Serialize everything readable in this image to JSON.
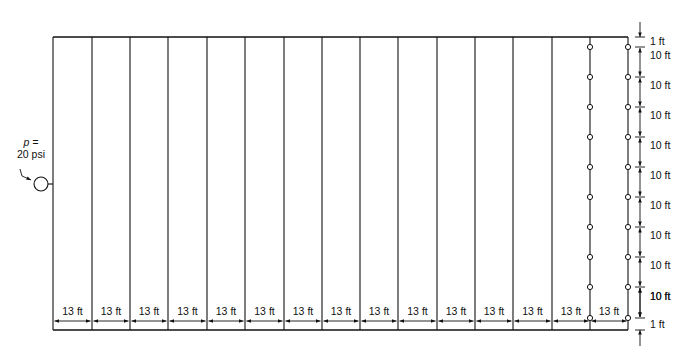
{
  "diagram": {
    "supply": {
      "label_line1": "p =",
      "label_line2": "20 psi",
      "pressure": "20 psi"
    },
    "branch_spacing_label": "13 ft",
    "branch_count": 15,
    "horizontal_dimensions": [
      "13 ft",
      "13 ft",
      "13 ft",
      "13 ft",
      "13 ft",
      "13 ft",
      "13 ft",
      "13 ft",
      "13 ft",
      "13 ft",
      "13 ft",
      "13 ft",
      "13 ft",
      "13 ft",
      "13 ft"
    ],
    "vertical_dimensions": [
      "1 ft",
      "10 ft",
      "10 ft",
      "10 ft",
      "10 ft",
      "10 ft",
      "10 ft",
      "10 ft",
      "10 ft",
      "10 ft",
      "10 ft",
      "1 ft"
    ],
    "sprinklers_per_branch": 10,
    "sprinkler_branches_shown": 2,
    "colors": {
      "line": "#111111",
      "background": "#ffffff"
    }
  }
}
